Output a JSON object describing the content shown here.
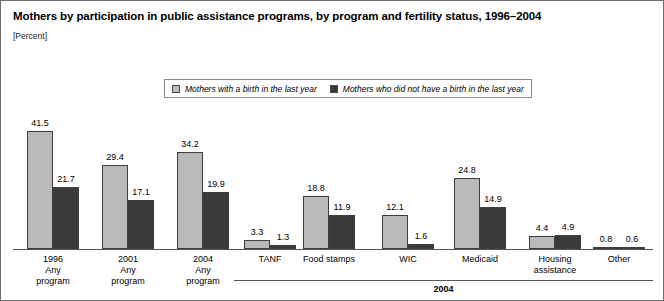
{
  "figure": {
    "title": "Mothers by participation in public assistance programs, by program and fertility status, 1996–2004",
    "units": "[Percent]",
    "bracket_label": "2004"
  },
  "legend": {
    "entries": [
      {
        "label": "Mothers with a birth in the last year",
        "color": "#b9b9b9",
        "name": "legend-swatch-with-birth"
      },
      {
        "label": "Mothers who did not have a birth in the last year",
        "color": "#3a3a3a",
        "name": "legend-swatch-no-birth"
      }
    ]
  },
  "chart_data": {
    "type": "bar",
    "title": "Mothers by participation in public assistance programs, by program and fertility status, 1996–2004",
    "subtitle": "[Percent]",
    "xlabel": "",
    "ylabel": "Percent",
    "ylim": [
      0,
      45
    ],
    "grid": false,
    "legend_position": "top-center",
    "categories": [
      "1996\nAny\nprogram",
      "2001\nAny\nprogram",
      "2004\nAny\nprogram",
      "TANF",
      "Food stamps",
      "WIC",
      "Medicaid",
      "Housing\nassistance",
      "Other"
    ],
    "series": [
      {
        "name": "Mothers with a birth in the last year",
        "color": "#b9b9b9",
        "values": [
          41.5,
          29.4,
          34.2,
          3.3,
          18.8,
          12.1,
          24.8,
          4.4,
          0.8
        ]
      },
      {
        "name": "Mothers who did not have a birth in the last year",
        "color": "#3a3a3a",
        "values": [
          21.7,
          17.1,
          19.9,
          1.3,
          11.9,
          1.6,
          14.9,
          4.9,
          0.6
        ]
      }
    ],
    "annotations": [
      {
        "text": "2004",
        "covers": [
          "TANF",
          "Food stamps",
          "WIC",
          "Medicaid",
          "Housing assistance",
          "Other"
        ]
      }
    ]
  }
}
